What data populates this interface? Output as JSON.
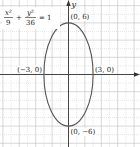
{
  "chart_data": {
    "type": "line",
    "title": "",
    "equation": {
      "x_num": "x²",
      "x_den": "9",
      "plus": "+",
      "y_num": "y²",
      "y_den": "36",
      "rhs": "= 1"
    },
    "xlabel": "",
    "ylabel": "y",
    "xlim": [
      -8.5,
      8.5
    ],
    "ylim": [
      -8.5,
      8.5
    ],
    "grid": true,
    "legend": null,
    "series": [
      {
        "name": "ellipse x^2/9 + y^2/36 = 1",
        "type": "ellipse",
        "center": [
          0,
          0
        ],
        "a": 3,
        "b": 6
      }
    ],
    "annotations": [
      {
        "label": "(0, 6)",
        "x": 0,
        "y": 6
      },
      {
        "label": "(−3, 0)",
        "x": -3,
        "y": 0
      },
      {
        "label": "(3, 0)",
        "x": 3,
        "y": 0
      },
      {
        "label": "(0, −6)",
        "x": 0,
        "y": -6
      }
    ]
  },
  "colors": {
    "curve": "#555555",
    "axis": "#444444",
    "grid_major": "#bdbdbd",
    "grid_minor": "#d6d6d6"
  }
}
